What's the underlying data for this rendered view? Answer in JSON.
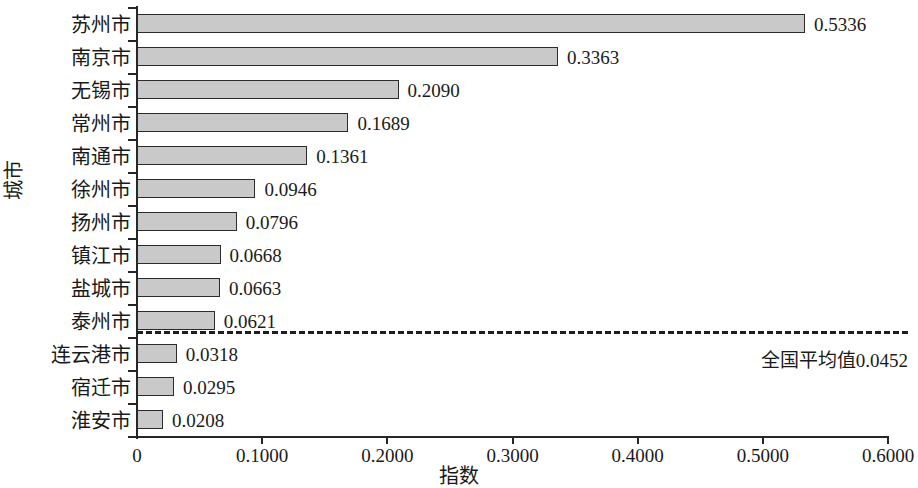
{
  "chart_data": {
    "type": "bar",
    "orientation": "horizontal",
    "title": "",
    "xlabel": "指数",
    "ylabel": "城市",
    "xlim": [
      0,
      0.6
    ],
    "grid": false,
    "legend": null,
    "categories": [
      "苏州市",
      "南京市",
      "无锡市",
      "常州市",
      "南通市",
      "徐州市",
      "扬州市",
      "镇江市",
      "盐城市",
      "泰州市",
      "连云港市",
      "宿迁市",
      "淮安市"
    ],
    "values": [
      0.5336,
      0.3363,
      0.209,
      0.1689,
      0.1361,
      0.0946,
      0.0796,
      0.0668,
      0.0663,
      0.0621,
      0.0318,
      0.0295,
      0.0208
    ],
    "value_labels": [
      "0.5336",
      "0.3363",
      "0.2090",
      "0.1689",
      "0.1361",
      "0.0946",
      "0.0796",
      "0.0668",
      "0.0663",
      "0.0621",
      "0.0318",
      "0.0295",
      "0.0208"
    ],
    "xticks": [
      0,
      0.1,
      0.2,
      0.3,
      0.4,
      0.5,
      0.6
    ],
    "xtick_labels": [
      "0",
      "0.1000",
      "0.2000",
      "0.3000",
      "0.4000",
      "0.5000",
      "0.6000"
    ],
    "annotations": [
      {
        "name": "national-average-line",
        "text": "全国平均值0.0452",
        "value": 0.0452,
        "style": "dashed-horizontal-separator",
        "position": "between 泰州市 and 连云港市"
      }
    ],
    "colors": {
      "bar_fill": "#c9c9c9",
      "bar_stroke": "#2b2b2b",
      "axis": "#262626",
      "text": "#1a1a1a",
      "background": "#ffffff"
    }
  }
}
